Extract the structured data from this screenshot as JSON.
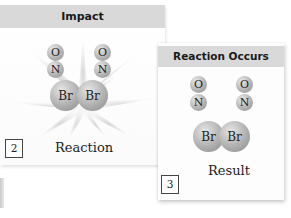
{
  "panels": [
    {
      "number": "2",
      "title": "Impact",
      "caption": "Reaction",
      "molecules": [
        {
          "top": "O",
          "bottom": "N"
        },
        {
          "top": "O",
          "bottom": "N"
        }
      ],
      "bromine": [
        "Br",
        "Br"
      ],
      "effect": "starburst"
    },
    {
      "number": "3",
      "title": "Reaction Occurs",
      "caption": "Result",
      "molecules": [
        {
          "top": "O",
          "bottom": "N"
        },
        {
          "top": "O",
          "bottom": "N"
        }
      ],
      "bromine": [
        "Br",
        "Br"
      ]
    }
  ],
  "colors": {
    "header_bg": "#d9d9d9",
    "atom_gray": "#b0b0b0",
    "text": "#222222"
  }
}
